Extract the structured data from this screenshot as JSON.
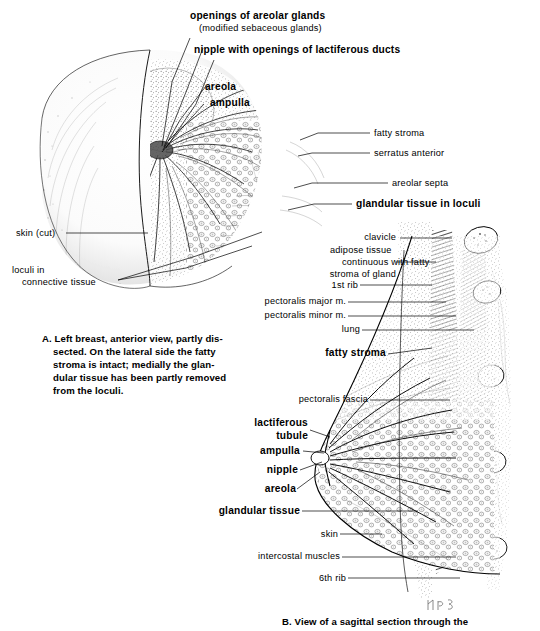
{
  "figure": {
    "type": "anatomical-illustration",
    "panels": [
      "A",
      "B"
    ]
  },
  "panel_a": {
    "id": "A",
    "caption": [
      "A. Left breast, anterior view, partly dis-",
      "    sected. On the lateral side the fatty",
      "    stroma is intact; medially the glan-",
      "    dular tissue has been partly removed",
      "    from the loculi."
    ],
    "labels": {
      "openings_title": "openings of areolar glands",
      "openings_sub": "(modified sebaceous glands)",
      "nipple_ducts": "nipple with openings of lactiferous ducts",
      "areola": "areola",
      "ampulla": "ampulla",
      "fatty_stroma": "fatty stroma",
      "serratus_anterior": "serratus anterior",
      "areolar_septa": "areolar septa",
      "glandular_tissue_loculi": "glandular tissue in loculi",
      "skin_cut": "skin (cut)",
      "loculi_line1": "loculi in",
      "loculi_line2": "connective tissue"
    }
  },
  "panel_b": {
    "id": "B",
    "caption": [
      "B. View of a sagittal section through the"
    ],
    "labels": {
      "clavicle": "clavicle",
      "adipose_line1": "adipose tissue",
      "adipose_line2": "continuous with fatty",
      "adipose_line3": "stroma of gland",
      "first_rib": "1st rib",
      "pectoralis_major": "pectoralis major m.",
      "pectoralis_minor": "pectoralis minor m.",
      "lung": "lung",
      "fatty_stroma": "fatty stroma",
      "pectoralis_fascia": "pectoralis fascia",
      "lactiferous_line1": "lactiferous",
      "lactiferous_line2": "tubule",
      "ampulla": "ampulla",
      "nipple": "nipple",
      "areola": "areola",
      "glandular_tissue": "glandular tissue",
      "skin": "skin",
      "intercostal_muscles": "intercostal muscles",
      "sixth_rib": "6th rib"
    }
  },
  "signature": "artist-monogram",
  "colors": {
    "ink": "#000000",
    "page": "#ffffff",
    "stipple": "#3a3a3a"
  }
}
